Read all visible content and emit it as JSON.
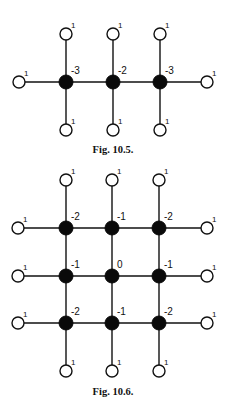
{
  "figures": [
    {
      "id": "fig-10-5",
      "caption": "Fig. 10.5.",
      "caption_pos": [
        113,
        153
      ],
      "open_radius": 6,
      "filled_radius": 7,
      "filled_nodes": [
        {
          "x": 66,
          "y": 82,
          "label": "-3"
        },
        {
          "x": 113,
          "y": 82,
          "label": "-2"
        },
        {
          "x": 160,
          "y": 82,
          "label": "-3"
        }
      ],
      "open_nodes": [
        {
          "x": 19,
          "y": 82,
          "label": "1"
        },
        {
          "x": 207,
          "y": 82,
          "label": "1"
        },
        {
          "x": 66,
          "y": 34,
          "label": "1"
        },
        {
          "x": 113,
          "y": 34,
          "label": "1"
        },
        {
          "x": 160,
          "y": 34,
          "label": "1"
        },
        {
          "x": 66,
          "y": 130,
          "label": "1"
        },
        {
          "x": 113,
          "y": 130,
          "label": "1"
        },
        {
          "x": 160,
          "y": 130,
          "label": "1"
        }
      ],
      "edges": [
        [
          19,
          82,
          66,
          82
        ],
        [
          66,
          82,
          113,
          82
        ],
        [
          113,
          82,
          160,
          82
        ],
        [
          160,
          82,
          207,
          82
        ],
        [
          66,
          34,
          66,
          82
        ],
        [
          113,
          34,
          113,
          82
        ],
        [
          160,
          34,
          160,
          82
        ],
        [
          66,
          82,
          66,
          130
        ],
        [
          113,
          82,
          113,
          130
        ],
        [
          160,
          82,
          160,
          130
        ]
      ]
    },
    {
      "id": "fig-10-6",
      "caption": "Fig. 10.6.",
      "caption_pos": [
        113,
        395
      ],
      "open_radius": 6,
      "filled_radius": 7,
      "filled_nodes": [
        {
          "x": 66,
          "y": 228,
          "label": "-2"
        },
        {
          "x": 112,
          "y": 228,
          "label": "-1"
        },
        {
          "x": 159,
          "y": 228,
          "label": "-2"
        },
        {
          "x": 66,
          "y": 276,
          "label": "-1"
        },
        {
          "x": 112,
          "y": 276,
          "label": "0"
        },
        {
          "x": 159,
          "y": 276,
          "label": "-1"
        },
        {
          "x": 66,
          "y": 323,
          "label": "-2"
        },
        {
          "x": 112,
          "y": 323,
          "label": "-1"
        },
        {
          "x": 159,
          "y": 323,
          "label": "-2"
        }
      ],
      "open_nodes": [
        {
          "x": 66,
          "y": 180,
          "label": "1"
        },
        {
          "x": 112,
          "y": 180,
          "label": "1"
        },
        {
          "x": 159,
          "y": 180,
          "label": "1"
        },
        {
          "x": 18,
          "y": 228,
          "label": "1"
        },
        {
          "x": 18,
          "y": 276,
          "label": "1"
        },
        {
          "x": 18,
          "y": 323,
          "label": "1"
        },
        {
          "x": 207,
          "y": 228,
          "label": "1"
        },
        {
          "x": 207,
          "y": 276,
          "label": "1"
        },
        {
          "x": 207,
          "y": 323,
          "label": "1"
        },
        {
          "x": 66,
          "y": 371,
          "label": "1"
        },
        {
          "x": 112,
          "y": 371,
          "label": "1"
        },
        {
          "x": 159,
          "y": 371,
          "label": "1"
        }
      ],
      "edges": [
        [
          18,
          228,
          207,
          228
        ],
        [
          18,
          276,
          207,
          276
        ],
        [
          18,
          323,
          207,
          323
        ],
        [
          66,
          180,
          66,
          371
        ],
        [
          112,
          180,
          112,
          371
        ],
        [
          159,
          180,
          159,
          371
        ]
      ]
    }
  ]
}
